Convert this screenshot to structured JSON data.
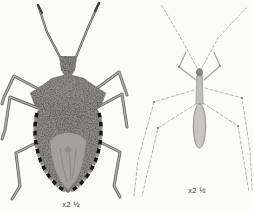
{
  "page": {
    "background": "#fbfbfa",
    "type": "book-plate illustration of two true bugs, dorsal views, side by side"
  },
  "figures": [
    {
      "id": "shield-bug",
      "subject": "dark mottled shield bug (stink bug), dorsal view, halftone photo style",
      "caption": "x2 ½"
    },
    {
      "id": "thread-legged-bug",
      "subject": "very slender pale long-legged bug, dorsal view, faint line-drawing style",
      "caption": "x2 ½"
    }
  ],
  "colors": {
    "bug_body_dark": "#403e3a",
    "bug_pronotum": "#454340",
    "bug_membrane": "#a6a4a0",
    "bug_leg_light": "#b3b1ad",
    "bug_leg_dark": "#6b6965",
    "pale_bug_line": "#aeaca8",
    "pale_bug_body": "#cfcdc9",
    "caption_text": "#3b3a38"
  }
}
